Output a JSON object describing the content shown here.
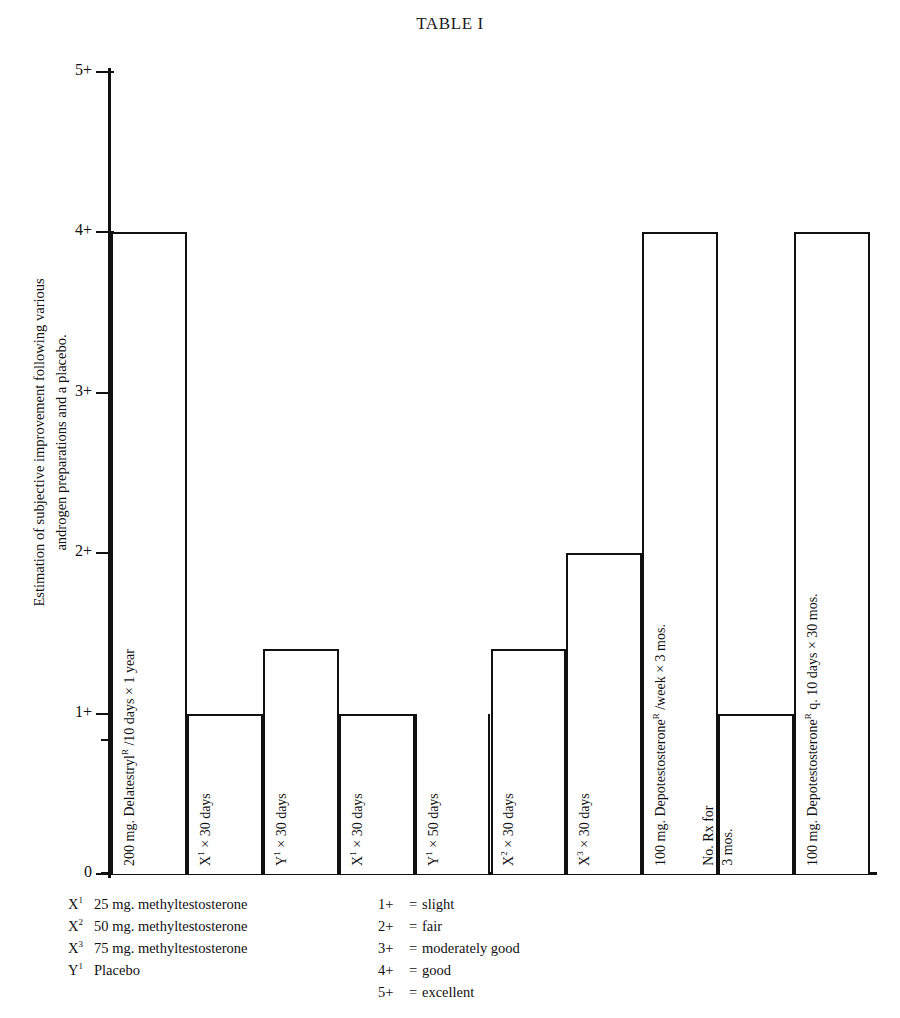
{
  "title": "TABLE I",
  "axis": {
    "y_caption_lines": [
      "Estimation of subjective improvement following various",
      "androgen preparations and a placebo."
    ],
    "y_ticks": [
      "5+",
      "4+",
      "3+",
      "2+",
      "1+",
      "0"
    ]
  },
  "legend_left": [
    {
      "key": "X",
      "sup": "1",
      "text": "25 mg. methyltestosterone"
    },
    {
      "key": "X",
      "sup": "2",
      "text": "50 mg. methyltestosterone"
    },
    {
      "key": "X",
      "sup": "3",
      "text": "75 mg. methyltestosterone"
    },
    {
      "key": "Y",
      "sup": "1",
      "text": "Placebo"
    }
  ],
  "legend_right": [
    {
      "key": "1+",
      "eq": "=",
      "text": "slight"
    },
    {
      "key": "2+",
      "eq": "=",
      "text": "fair"
    },
    {
      "key": "3+",
      "eq": "=",
      "text": "moderately good"
    },
    {
      "key": "4+",
      "eq": "=",
      "text": "good"
    },
    {
      "key": "5+",
      "eq": "=",
      "text": "excellent"
    }
  ],
  "chart_data": {
    "type": "bar",
    "title": "TABLE I",
    "xlabel": "",
    "ylabel": "Estimation of subjective improvement following various androgen preparations and a placebo.",
    "ylim": [
      0,
      5
    ],
    "ytick_labels": [
      "0",
      "1+",
      "2+",
      "3+",
      "4+",
      "5+"
    ],
    "ytick_values": [
      0,
      1,
      2,
      3,
      4,
      5
    ],
    "grid": false,
    "legend_position": "below-axes",
    "categories": [
      "200 mg. Delatestrylᴿ /10 days × 1 year",
      "X¹ × 30 days",
      "Y¹ × 30 days",
      "X¹ × 30 days",
      "Y¹ × 50 days",
      "X² × 30 days",
      "X³ × 30 days",
      "100 mg. Depotestosteroneᴿ /week × 3 mos.",
      "No. Rx for 3 mos.",
      "100 mg. Depotestosteroneᴿ q. 10 days × 30 mos."
    ],
    "values": [
      4,
      1,
      1.4,
      1,
      0,
      1.4,
      2,
      4,
      1,
      4
    ]
  },
  "bars": [
    {
      "name": "bar-delatestryl",
      "value": 4,
      "label_lines": [
        {
          "pre": "200 mg. Delatestryl",
          "sup": "R",
          "post": " /10 days × 1 year"
        }
      ]
    },
    {
      "name": "bar-x1-30-days-a",
      "value": 1,
      "label_lines": [
        {
          "pre": "X",
          "sup": "1",
          "post": " × 30 days"
        }
      ]
    },
    {
      "name": "bar-y1-30-days",
      "value": 1.4,
      "label_lines": [
        {
          "pre": "Y",
          "sup": "1",
          "post": " × 30 days"
        }
      ]
    },
    {
      "name": "bar-x1-30-days-b",
      "value": 1,
      "label_lines": [
        {
          "pre": "X",
          "sup": "1",
          "post": " × 30 days"
        }
      ]
    },
    {
      "name": "bar-y1-50-days",
      "value": 0,
      "label_lines": [
        {
          "pre": "Y",
          "sup": "1",
          "post": " × 50 days"
        }
      ]
    },
    {
      "name": "bar-x2-30-days",
      "value": 1.4,
      "label_lines": [
        {
          "pre": "X",
          "sup": "2",
          "post": " × 30 days"
        }
      ]
    },
    {
      "name": "bar-x3-30-days",
      "value": 2,
      "label_lines": [
        {
          "pre": "X",
          "sup": "3",
          "post": " × 30 days"
        }
      ]
    },
    {
      "name": "bar-depotestosterone-week",
      "value": 4,
      "label_lines": [
        {
          "pre": "100 mg. Depotestosterone",
          "sup": "R",
          "post": " /week × 3 mos."
        }
      ]
    },
    {
      "name": "bar-no-rx",
      "value": 1,
      "label_lines": [
        {
          "pre": "No. Rx for",
          "sup": "",
          "post": ""
        },
        {
          "pre": "3 mos.",
          "sup": "",
          "post": ""
        }
      ]
    },
    {
      "name": "bar-depotestosterone-10-days",
      "value": 4,
      "label_lines": [
        {
          "pre": "100 mg. Depotestosterone",
          "sup": "R",
          "post": " q. 10 days × 30 mos."
        }
      ]
    }
  ]
}
